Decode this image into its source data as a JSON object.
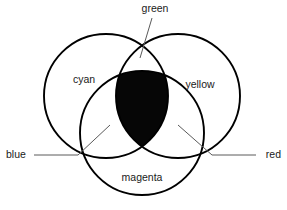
{
  "diagram": {
    "background_color": "#ffffff",
    "stroke_color": "#000000",
    "intersection_fill_color": "#060606",
    "leader_color": "#5a5a5a",
    "text_color": "#1a1a1a",
    "type": "venn-3-circle",
    "circles": [
      {
        "id": "cyan",
        "label": "cyan",
        "cx": 106,
        "cy": 96,
        "r": 62
      },
      {
        "id": "yellow",
        "label": "yellow",
        "cx": 178,
        "cy": 96,
        "r": 62
      },
      {
        "id": "magenta",
        "label": "magenta",
        "cx": 142,
        "cy": 133,
        "r": 62
      }
    ],
    "region_labels": [
      {
        "id": "cyan",
        "text": "cyan",
        "x": 84,
        "y": 80
      },
      {
        "id": "yellow",
        "text": "yellow",
        "x": 200,
        "y": 85
      },
      {
        "id": "magenta",
        "text": "magenta",
        "x": 142,
        "y": 178
      },
      {
        "id": "green",
        "text": "green",
        "x": 155,
        "y": 9
      },
      {
        "id": "blue",
        "text": "blue",
        "x": 6,
        "y": 155
      },
      {
        "id": "red",
        "text": "red",
        "x": 281,
        "y": 155
      }
    ],
    "callouts": [
      {
        "id": "green-callout",
        "label": "green",
        "from_x": 152,
        "from_y": 18,
        "to_x": 140,
        "to_y": 58
      },
      {
        "id": "blue-callout",
        "label": "blue",
        "from_x": 34,
        "from_y": 155,
        "mid_x": 78,
        "mid_y": 155,
        "to_x": 110,
        "to_y": 125
      },
      {
        "id": "red-callout",
        "label": "red",
        "from_x": 256,
        "from_y": 155,
        "mid_x": 212,
        "mid_y": 155,
        "to_x": 178,
        "to_y": 125
      }
    ]
  }
}
